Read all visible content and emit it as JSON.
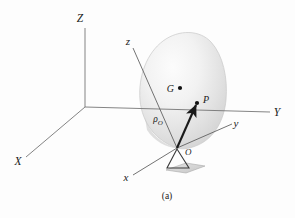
{
  "figure": {
    "caption": "(a)",
    "background_color": "#fdfdfd",
    "ink_color": "#1a1a1a",
    "axis_color": "#6b6b6b"
  },
  "global_frame": {
    "name": "global-reference-frame",
    "origin": {
      "x": 85,
      "y": 107
    },
    "axes": [
      {
        "id": "Z",
        "label": "Z",
        "label_x": 80,
        "label_y": 22,
        "tip_x": 85,
        "tip_y": 28,
        "case": "upper"
      },
      {
        "id": "X",
        "label": "X",
        "label_x": 18,
        "label_y": 165,
        "tip_x": 26,
        "tip_y": 157,
        "case": "upper"
      },
      {
        "id": "Y",
        "label": "Y",
        "label_x": 277,
        "label_y": 116,
        "tip_x": 270,
        "tip_y": 112,
        "case": "upper"
      }
    ]
  },
  "body_frame": {
    "name": "body-fixed-frame",
    "origin": {
      "x": 177,
      "y": 148
    },
    "origin_label": "O",
    "origin_label_x": 185,
    "origin_label_y": 154,
    "axes": [
      {
        "id": "z",
        "label": "z",
        "label_x": 128,
        "label_y": 45,
        "tip_x": 133,
        "tip_y": 48,
        "case": "lower"
      },
      {
        "id": "x",
        "label": "x",
        "label_x": 126,
        "label_y": 181,
        "tip_x": 133,
        "tip_y": 175,
        "case": "lower"
      },
      {
        "id": "y",
        "label": "y",
        "label_x": 236,
        "label_y": 127,
        "tip_x": 232,
        "tip_y": 124,
        "case": "lower"
      }
    ]
  },
  "points": [
    {
      "id": "G",
      "label": "G",
      "role": "center-of-mass",
      "dot_x": 180,
      "dot_y": 88,
      "label_x": 167,
      "label_y": 92
    },
    {
      "id": "P",
      "label": "P",
      "role": "material-point",
      "dot_x": 197,
      "dot_y": 103,
      "label_x": 204,
      "label_y": 103
    }
  ],
  "vectors": [
    {
      "id": "rho-0",
      "label_base": "ρ",
      "label_subscript": "O",
      "label_full": "ρO",
      "from": "O",
      "to": "P",
      "start_x": 177,
      "start_y": 148,
      "end_x": 196,
      "end_y": 105,
      "label_x": 158,
      "label_y": 122
    }
  ],
  "body": {
    "name": "rigid-body-blob",
    "shape": "ovoid",
    "fill_light": "#fafafa",
    "fill_mid": "#e6e6e6",
    "fill_shadow": "#cfcfcf",
    "outline_color": "#c9c9c9"
  },
  "support": {
    "name": "pedestal",
    "triangle_color": "#3a3a3a",
    "base_plate_color": "#d8d8d8"
  }
}
